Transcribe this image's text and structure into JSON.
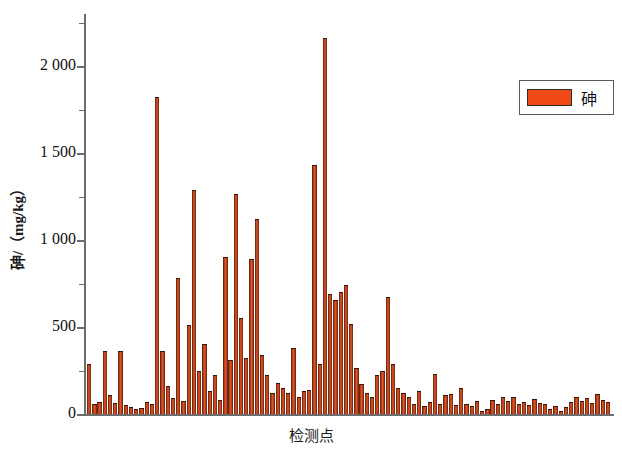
{
  "chart_data": {
    "type": "bar",
    "title": "",
    "xlabel": "检测点",
    "ylabel": "砷/（mg/kg）",
    "ylim": [
      0,
      2300
    ],
    "grid": false,
    "legend": {
      "position": "top-right",
      "entries": [
        {
          "name": "砷",
          "color": "#ef4a16"
        }
      ]
    },
    "y_ticks_major": [
      0,
      500,
      1000,
      1500,
      2000
    ],
    "y_tick_labels": [
      "0",
      "500",
      "1 000",
      "1 500",
      "2 000"
    ],
    "y_ticks_minor": [
      250,
      750,
      1250,
      1750,
      2250
    ],
    "series": [
      {
        "name": "砷",
        "color": "#ef4a16",
        "values": [
          290,
          60,
          70,
          360,
          110,
          65,
          360,
          50,
          40,
          30,
          35,
          70,
          55,
          1820,
          360,
          160,
          90,
          780,
          75,
          510,
          1290,
          250,
          405,
          130,
          225,
          80,
          900,
          310,
          1265,
          550,
          320,
          890,
          1120,
          340,
          225,
          120,
          180,
          150,
          120,
          380,
          95,
          130,
          140,
          1430,
          290,
          2160,
          690,
          655,
          700,
          740,
          520,
          265,
          170,
          120,
          100,
          225,
          250,
          670,
          290,
          150,
          120,
          95,
          60,
          135,
          45,
          70,
          230,
          60,
          110,
          115,
          50,
          150,
          60,
          45,
          75,
          20,
          30,
          80,
          55,
          95,
          75,
          95,
          60,
          70,
          50,
          85,
          65,
          60,
          30,
          45,
          20,
          40,
          70,
          100,
          75,
          90,
          65,
          115,
          80,
          70
        ]
      }
    ]
  }
}
